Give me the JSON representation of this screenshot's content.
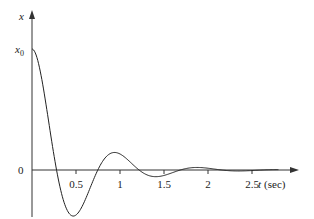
{
  "chart_data": {
    "type": "line",
    "title": "",
    "xlabel": "t (sec)",
    "xlabel_var": "t",
    "xlabel_unit": "(sec)",
    "ylabel": "x",
    "y_tick_labels": [
      "x0",
      "0"
    ],
    "y_tick_label_x0": {
      "main": "x",
      "sub": "0"
    },
    "y_tick_label_zero": "0",
    "x_ticks": [
      0.5,
      1,
      1.5,
      2,
      2.5
    ],
    "x_tick_labels": [
      "0.5",
      "1",
      "1.5",
      "2",
      "2.5"
    ],
    "xlim": [
      0,
      2.95
    ],
    "ylim_relative_to_x0": [
      -0.4,
      1.3
    ],
    "grid": false,
    "legend": null,
    "series": [
      {
        "name": "x(t) damped free response",
        "initial_value": "x0",
        "decay_rate": 2.06,
        "damped_frequency_rad_s": 6.7,
        "x": [
          0,
          0.1,
          0.2,
          0.31,
          0.4,
          0.5,
          0.6,
          0.7,
          0.82,
          0.9,
          1.0,
          1.05,
          1.1,
          1.2,
          1.3,
          1.4,
          1.5,
          1.6,
          1.8,
          2.0,
          2.2,
          2.5,
          2.8
        ],
        "values": [
          1.0,
          0.79,
          0.39,
          0.0,
          -0.22,
          -0.34,
          -0.3,
          -0.17,
          0.0,
          0.08,
          0.13,
          0.13,
          0.12,
          0.08,
          0.03,
          -0.01,
          -0.04,
          -0.04,
          -0.02,
          0.01,
          0.01,
          0.0,
          0.0
        ]
      }
    ]
  },
  "axes": {
    "y_axis_label": "x",
    "x_axis_label_var": "t",
    "x_axis_label_unit": "(sec)",
    "x0_main": "x",
    "x0_sub": "0",
    "zero_label": "0"
  }
}
